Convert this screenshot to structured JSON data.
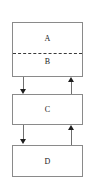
{
  "diagram": {
    "background_color": "#ffffff",
    "border_color": "#8a8a8a",
    "connector_color": "#6f6f6f",
    "arrow_color": "#1f1f1f",
    "divider_color": "#3a3a3a",
    "nodes": [
      {
        "id": "A",
        "label": "A"
      },
      {
        "id": "B",
        "label": "B"
      },
      {
        "id": "C",
        "label": "C"
      },
      {
        "id": "D",
        "label": "D"
      }
    ],
    "groups": [
      {
        "id": "AB",
        "members": [
          "A",
          "B"
        ],
        "divider_style": "dashed"
      }
    ],
    "edges": [
      {
        "from": "AB",
        "to": "C",
        "direction": "down",
        "side": "left",
        "arrowhead": "filled"
      },
      {
        "from": "C",
        "to": "AB",
        "direction": "up",
        "side": "right",
        "arrowhead": "filled"
      },
      {
        "from": "C",
        "to": "D",
        "direction": "down",
        "side": "left",
        "arrowhead": "filled"
      },
      {
        "from": "D",
        "to": "C",
        "direction": "up",
        "side": "right",
        "arrowhead": "filled"
      }
    ]
  }
}
